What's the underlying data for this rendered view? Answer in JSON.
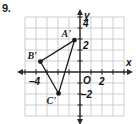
{
  "problem": {
    "number": "9."
  },
  "axes": {
    "x_label": "x",
    "y_label": "y",
    "origin_label": "O",
    "x_ticks": [
      {
        "value": -4,
        "label": "–4"
      },
      {
        "value": 2,
        "label": "2"
      }
    ],
    "y_ticks": [
      {
        "value": 4,
        "label": "4"
      },
      {
        "value": 2,
        "label": "2"
      },
      {
        "value": -2,
        "label": "–2"
      }
    ],
    "x_range": [
      -5,
      4
    ],
    "y_range": [
      -4,
      5
    ],
    "grid": true,
    "grid_color": "#b9b9b9",
    "axis_color": "#2b2b2b"
  },
  "figure": {
    "type": "triangle",
    "name": "A'B'C'",
    "fill": "none",
    "stroke": "#1a1a1a",
    "vertices": [
      {
        "label": "A'",
        "x": -0.5,
        "y": 2.9,
        "label_dx": -13,
        "label_dy": -11
      },
      {
        "label": "B'",
        "x": -3.6,
        "y": 0.95,
        "label_dx": -13,
        "label_dy": -11
      },
      {
        "label": "C'",
        "x": -1.95,
        "y": -1.95,
        "label_dx": -12,
        "label_dy": 3
      }
    ]
  },
  "chart_data": {
    "type": "scatter",
    "title": "",
    "xlabel": "x",
    "ylabel": "y",
    "xlim": [
      -5,
      4
    ],
    "ylim": [
      -4,
      5
    ],
    "grid": true,
    "points": [
      {
        "name": "A'",
        "x": -0.5,
        "y": 3
      },
      {
        "name": "B'",
        "x": -3.6,
        "y": 1
      },
      {
        "name": "C'",
        "x": -2,
        "y": -2
      }
    ]
  }
}
